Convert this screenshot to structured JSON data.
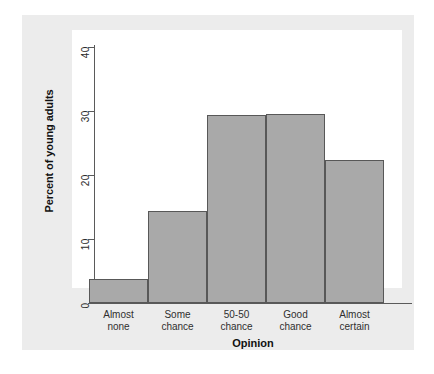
{
  "chart_data": {
    "type": "bar",
    "title": "",
    "subtitle": "",
    "xlabel": "Opinion",
    "ylabel": "Percent of young adults",
    "categories": [
      "Almost none",
      "Some chance",
      "50-50 chance",
      "Good chance",
      "Almost certain"
    ],
    "category_lines": [
      [
        "Almost",
        "none"
      ],
      [
        "Some",
        "chance"
      ],
      [
        "50-50",
        "chance"
      ],
      [
        "Good",
        "chance"
      ],
      [
        "Almost",
        "certain"
      ]
    ],
    "values": [
      3.7,
      14.3,
      29.4,
      29.5,
      22.4
    ],
    "ylim": [
      0,
      40
    ],
    "yticks": [
      0,
      10,
      20,
      30,
      40
    ],
    "ytick_labels": [
      "0",
      "10",
      "20",
      "30",
      "40"
    ],
    "grid": false,
    "legend": false,
    "bar_fill": "#a9a9a9",
    "bar_edge": "#585858",
    "panel_background": "#ececec",
    "plot_background": "#ffffff",
    "axis_color": "#5a5a5a"
  }
}
